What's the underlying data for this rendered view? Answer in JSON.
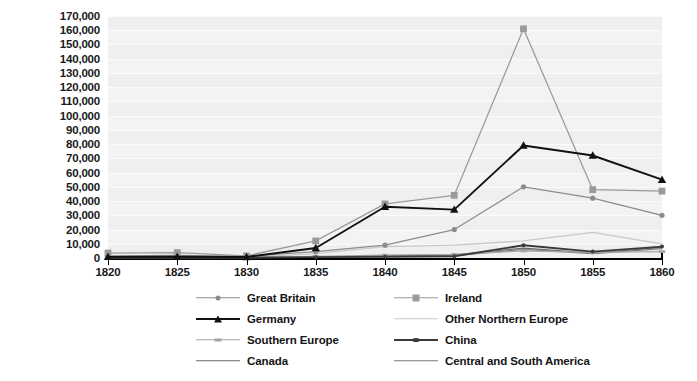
{
  "chart_data": {
    "type": "line",
    "title": "",
    "subtitle": "",
    "xlabel": "",
    "ylabel": "",
    "x": [
      1820,
      1825,
      1830,
      1835,
      1840,
      1845,
      1850,
      1855,
      1860
    ],
    "xlim": [
      1820,
      1860
    ],
    "ylim": [
      0,
      170000
    ],
    "ytick_step": 10000,
    "grid": true,
    "legend_position": "bottom",
    "xtick_labels": [
      "1820",
      "1825",
      "1830",
      "1835",
      "1840",
      "1845",
      "1850",
      "1855",
      "1860"
    ],
    "ytick_labels": [
      "0",
      "10,000",
      "20,000",
      "30,000",
      "40,000",
      "50,000",
      "60,000",
      "70,000",
      "80,000",
      "90,000",
      "100,000",
      "110,000",
      "120,000",
      "130,000",
      "140,000",
      "150,000",
      "160,000",
      "170,000"
    ],
    "series": [
      {
        "name": "Great Britain",
        "marker": "circle",
        "color": "#8c8c8c",
        "values": [
          1500,
          1800,
          1200,
          4500,
          9000,
          20000,
          50000,
          42000,
          30000
        ]
      },
      {
        "name": "Ireland",
        "marker": "square",
        "color": "#9a9a9a",
        "values": [
          3500,
          3800,
          1500,
          12000,
          38000,
          44000,
          161000,
          48000,
          47000
        ]
      },
      {
        "name": "Germany",
        "marker": "triangle",
        "color": "#111111",
        "values": [
          800,
          900,
          700,
          7000,
          36000,
          34000,
          79000,
          72000,
          55000
        ]
      },
      {
        "name": "Other Northern Europe",
        "marker": "none",
        "color": "#c9c9c9",
        "values": [
          500,
          600,
          500,
          3000,
          8000,
          9000,
          12000,
          18000,
          10000
        ]
      },
      {
        "name": "Southern Europe",
        "marker": "dash",
        "color": "#a5a5a5",
        "values": [
          400,
          500,
          400,
          1200,
          2000,
          2500,
          5000,
          4000,
          4500
        ]
      },
      {
        "name": "China",
        "marker": "dot",
        "color": "#3a3a3a",
        "values": [
          200,
          250,
          200,
          600,
          900,
          1200,
          9000,
          4500,
          8000
        ]
      },
      {
        "name": "Canada",
        "marker": "none",
        "color": "#6b6b6b",
        "values": [
          300,
          350,
          300,
          800,
          1500,
          2000,
          7000,
          3500,
          7500
        ]
      },
      {
        "name": "Central and South America",
        "marker": "none",
        "color": "#7d7d7d",
        "values": [
          250,
          300,
          250,
          700,
          1100,
          1600,
          6000,
          3000,
          6500
        ]
      }
    ]
  },
  "legend": {
    "items": [
      {
        "label": "Great Britain",
        "column": "a",
        "row": 0
      },
      {
        "label": "Ireland",
        "column": "b",
        "row": 0
      },
      {
        "label": "Germany",
        "column": "a",
        "row": 1
      },
      {
        "label": "Other Northern Europe",
        "column": "b",
        "row": 1
      },
      {
        "label": "Southern Europe",
        "column": "a",
        "row": 2
      },
      {
        "label": "China",
        "column": "b",
        "row": 2
      },
      {
        "label": "Canada",
        "column": "a",
        "row": 3
      },
      {
        "label": "Central and South America",
        "column": "b",
        "row": 3
      }
    ]
  },
  "colors": {
    "plot_background": "#f3f3f3",
    "gridline": "#fbfbfb",
    "axis": "#000000",
    "text": "#1a1a1a"
  }
}
